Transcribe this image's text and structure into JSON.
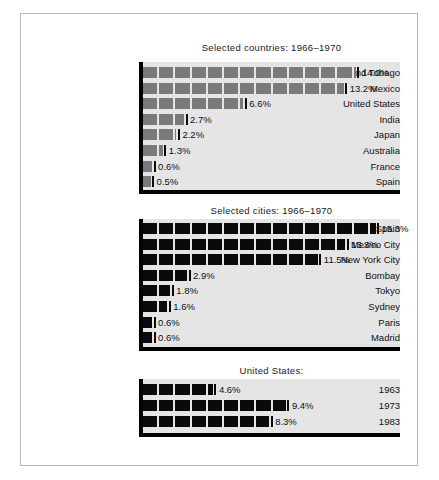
{
  "figure": {
    "background_color": "#ffffff",
    "frame_color": "#b9b9b9",
    "plot_background_color": "#e5e5e5",
    "axis_color": "#000000"
  },
  "chart_data": [
    {
      "type": "bar",
      "orientation": "horizontal",
      "title": "Selected countries: 1966–1970",
      "xlabel": "",
      "ylabel": "",
      "xlim": [
        0,
        17
      ],
      "grid": false,
      "legend": "none",
      "bar_color": "#7a7a7a",
      "categories": [
        "Trinidad and Tobago",
        "Mexico",
        "United States",
        "India",
        "Japan",
        "Australia",
        "France",
        "Spain"
      ],
      "values": [
        14.0,
        13.2,
        6.6,
        2.7,
        2.2,
        1.3,
        0.6,
        0.5
      ],
      "data_labels": [
        "14.0%",
        "13.2%",
        "6.6%",
        "2.7%",
        "2.2%",
        "1.3%",
        "0.6%",
        "0.5%"
      ]
    },
    {
      "type": "bar",
      "orientation": "horizontal",
      "title": "Selected cities: 1966–1970",
      "xlabel": "",
      "ylabel": "",
      "xlim": [
        0,
        17
      ],
      "grid": false,
      "legend": "none",
      "bar_color": "#0a0a0a",
      "categories": [
        "Port of Spain",
        "Mexico City",
        "New York City",
        "Bombay",
        "Tokyo",
        "Sydney",
        "Paris",
        "Madrid"
      ],
      "values": [
        15.3,
        13.3,
        11.5,
        2.9,
        1.8,
        1.6,
        0.6,
        0.6
      ],
      "data_labels": [
        "15.3%",
        "13.3%",
        "11.5%",
        "2.9%",
        "1.8%",
        "1.6%",
        "0.6%",
        "0.6%"
      ]
    },
    {
      "type": "bar",
      "orientation": "horizontal",
      "title": "United States:",
      "xlabel": "",
      "ylabel": "",
      "xlim": [
        0,
        17
      ],
      "grid": false,
      "legend": "none",
      "bar_color": "#0a0a0a",
      "categories": [
        "1963",
        "1973",
        "1983"
      ],
      "values": [
        4.6,
        9.4,
        8.3
      ],
      "data_labels": [
        "4.6%",
        "9.4%",
        "8.3%"
      ]
    }
  ]
}
